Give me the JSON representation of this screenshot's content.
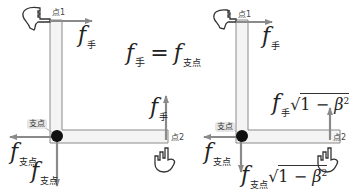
{
  "equation": {
    "lhs_symbol": "f",
    "lhs_sub": "手",
    "operator": "=",
    "rhs_symbol": "f",
    "rhs_sub": "支点"
  },
  "left_panel": {
    "point1_label": "点1",
    "point2_label": "点2",
    "pivot_label": "支点",
    "force_hand_top": {
      "symbol": "f",
      "sub": "手"
    },
    "force_hand_right": {
      "symbol": "f",
      "sub": "手"
    },
    "force_pivot_horizontal": {
      "symbol": "f",
      "sub": "支点"
    },
    "force_pivot_vertical": {
      "symbol": "f",
      "sub": "支点"
    }
  },
  "right_panel": {
    "point1_label": "点1",
    "point2_label": "点2",
    "pivot_label": "支点",
    "force_hand_top": {
      "symbol": "f",
      "sub": "手"
    },
    "force_hand_right": {
      "symbol": "f",
      "sub": "手",
      "factor": "√",
      "radicand_one": "1",
      "minus": "−",
      "beta": "β",
      "exp": "2"
    },
    "force_pivot_horizontal": {
      "symbol": "f",
      "sub": "支点"
    },
    "force_pivot_vertical": {
      "symbol": "f",
      "sub": "支点",
      "factor": "√",
      "radicand_one": "1",
      "minus": "−",
      "beta": "β",
      "exp": "2"
    }
  },
  "colors": {
    "bar_fill": "#f4f4f4",
    "bar_stroke": "#8a8a8a",
    "arrow": "#7a7a7a",
    "pivot": "#111111",
    "text": "#222222"
  }
}
